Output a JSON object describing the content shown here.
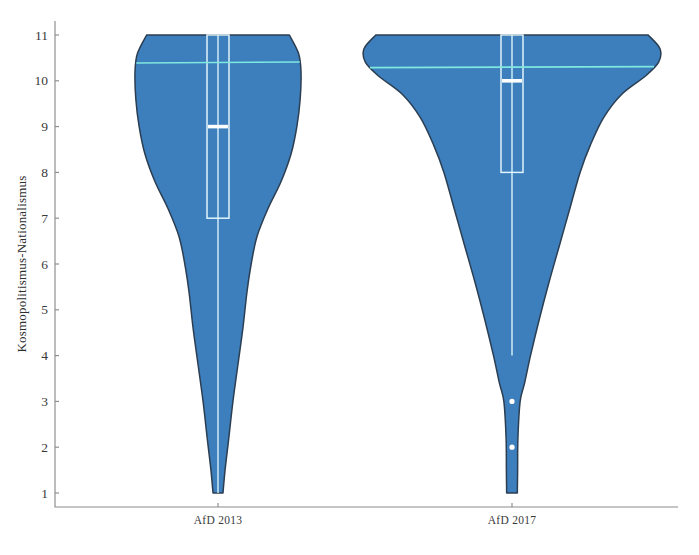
{
  "chart_data": {
    "type": "violin",
    "title": "",
    "xlabel": "",
    "ylabel": "Kosmopolitismus-Nationalismus",
    "ylim": [
      1,
      11
    ],
    "yticks": [
      1,
      2,
      3,
      4,
      5,
      6,
      7,
      8,
      9,
      10,
      11
    ],
    "ytick_labels": [
      "1",
      "2",
      "3",
      "4",
      "5",
      "6",
      "7",
      "8",
      "9",
      "10",
      "11"
    ],
    "categories": [
      "AfD 2013",
      "AfD 2017"
    ],
    "grid": false,
    "legend": "none",
    "colors": {
      "violin_fill": "#3d7ebc",
      "violin_outline": "#2b3e52",
      "box_outline": "#dff4fc",
      "median": "#ffffff",
      "mean_line": "#7fe8e0",
      "axis": "#8c8c8c",
      "text": "#3a3a3a",
      "background": "#ffffff",
      "outlier": "#ffffff"
    },
    "series": [
      {
        "name": "AfD 2013",
        "median": 9.0,
        "mean": 10.4,
        "q1": 7.0,
        "q3": 11.0,
        "whisker_low": 1.0,
        "whisker_high": 11.0,
        "data_min": 1.0,
        "data_max": 11.0,
        "outliers": [],
        "density_profile": [
          {
            "value": 11.0,
            "width": 0.86
          },
          {
            "value": 10.6,
            "width": 0.97
          },
          {
            "value": 10.2,
            "width": 1.0
          },
          {
            "value": 9.6,
            "width": 0.99
          },
          {
            "value": 9.0,
            "width": 0.95
          },
          {
            "value": 8.4,
            "width": 0.88
          },
          {
            "value": 7.8,
            "width": 0.76
          },
          {
            "value": 7.2,
            "width": 0.6
          },
          {
            "value": 6.6,
            "width": 0.47
          },
          {
            "value": 6.0,
            "width": 0.4
          },
          {
            "value": 5.4,
            "width": 0.35
          },
          {
            "value": 4.6,
            "width": 0.3
          },
          {
            "value": 3.8,
            "width": 0.24
          },
          {
            "value": 3.0,
            "width": 0.18
          },
          {
            "value": 2.2,
            "width": 0.13
          },
          {
            "value": 1.5,
            "width": 0.085
          },
          {
            "value": 1.0,
            "width": 0.06
          }
        ]
      },
      {
        "name": "AfD 2017",
        "median": 10.0,
        "mean": 10.3,
        "q1": 8.0,
        "q3": 11.0,
        "whisker_low": 4.0,
        "whisker_high": 11.0,
        "data_min": 1.0,
        "data_max": 11.0,
        "outliers": [
          3.0,
          2.0
        ],
        "density_profile": [
          {
            "value": 11.0,
            "width": 0.92
          },
          {
            "value": 10.7,
            "width": 1.0
          },
          {
            "value": 10.4,
            "width": 0.99
          },
          {
            "value": 10.1,
            "width": 0.9
          },
          {
            "value": 9.7,
            "width": 0.74
          },
          {
            "value": 9.2,
            "width": 0.62
          },
          {
            "value": 8.6,
            "width": 0.53
          },
          {
            "value": 8.0,
            "width": 0.46
          },
          {
            "value": 7.2,
            "width": 0.39
          },
          {
            "value": 6.4,
            "width": 0.32
          },
          {
            "value": 5.6,
            "width": 0.25
          },
          {
            "value": 4.8,
            "width": 0.185
          },
          {
            "value": 4.0,
            "width": 0.125
          },
          {
            "value": 3.4,
            "width": 0.085
          },
          {
            "value": 3.0,
            "width": 0.055
          },
          {
            "value": 2.2,
            "width": 0.04
          },
          {
            "value": 1.5,
            "width": 0.038
          },
          {
            "value": 1.0,
            "width": 0.036
          }
        ]
      }
    ]
  },
  "axes": {
    "y_axis_label": "Kosmopolitismus-Nationalismus",
    "y_ticks": [
      "11",
      "10",
      "9",
      "8",
      "7",
      "6",
      "5",
      "4",
      "3",
      "2",
      "1"
    ],
    "x_ticks": [
      "AfD 2013",
      "AfD 2017"
    ]
  }
}
